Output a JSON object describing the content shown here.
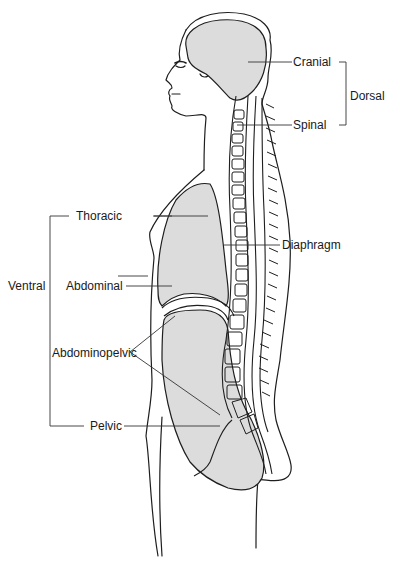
{
  "diagram": {
    "colors": {
      "cavity_fill": "#dcdcdc",
      "outline": "#1e1e1e",
      "leader": "#333333",
      "background": "#ffffff"
    },
    "groups": {
      "dorsal": {
        "label": "Dorsal",
        "members": [
          "Cranial",
          "Spinal"
        ]
      },
      "ventral": {
        "label": "Ventral",
        "members": [
          "Thoracic",
          "Abdominal",
          "Pelvic"
        ]
      }
    },
    "labels": {
      "cranial": "Cranial",
      "spinal": "Spinal",
      "dorsal": "Dorsal",
      "thoracic": "Thoracic",
      "diaphragm": "Diaphragm",
      "ventral": "Ventral",
      "abdominal": "Abdominal",
      "abdominopelvic": "Abdominopelvic",
      "pelvic": "Pelvic"
    }
  }
}
